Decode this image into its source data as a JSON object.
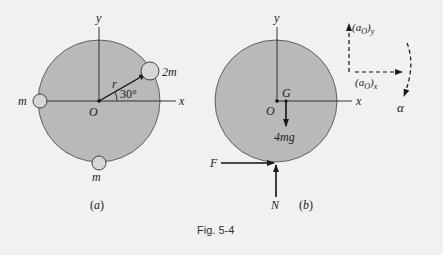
{
  "figure": {
    "caption": "Fig. 5-4",
    "colors": {
      "background": "#f1f1ef",
      "disc_fill": "#b9b9b9",
      "mass_fill": "#d6d6d6",
      "ink": "#1a1a1a"
    }
  },
  "panel_a": {
    "label": "(a)",
    "axis_x": "x",
    "axis_y": "y",
    "origin": "O",
    "radius_label": "r",
    "angle_label": "30°",
    "masses": [
      {
        "label": "2m",
        "position": "at 30° on rim"
      },
      {
        "label": "m",
        "position": "left of rim"
      },
      {
        "label": "m",
        "position": "bottom of rim"
      }
    ]
  },
  "panel_b": {
    "label": "(b)",
    "axis_x": "x",
    "axis_y": "y",
    "origin": "O",
    "center_of_mass": "G",
    "weight": "4mg",
    "friction": "F",
    "normal": "N"
  },
  "kinematics": {
    "a_oy_main": "(a",
    "a_oy_sub": "O",
    "a_oy_end": ")",
    "a_oy_axis": "y",
    "a_ox_main": "(a",
    "a_ox_sub": "O",
    "a_ox_end": ")",
    "a_ox_axis": "x",
    "angular": "α"
  }
}
